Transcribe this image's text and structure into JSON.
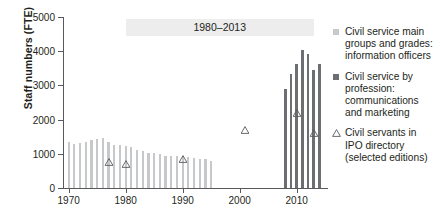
{
  "chart_data": {
    "type": "bar",
    "title": "",
    "xlabel": "",
    "ylabel": "Staff numbers (FTE)",
    "xlim": [
      1969,
      2015.5
    ],
    "ylim": [
      0,
      5000
    ],
    "ytick_labels": [
      "0",
      "1000",
      "2000",
      "3000",
      "4000",
      "5000"
    ],
    "ytick_values": [
      0,
      1000,
      2000,
      3000,
      4000,
      5000
    ],
    "xtick_labels": [
      "1970",
      "1980",
      "1990",
      "2000",
      "2010"
    ],
    "xtick_values": [
      1970,
      1980,
      1990,
      2000,
      2010
    ],
    "grid": false,
    "legend_position": "right",
    "annotations": [
      {
        "name": "range-band",
        "text": "1980–2013",
        "x_start": 1980,
        "x_end": 2013,
        "y": 4700
      }
    ],
    "series": [
      {
        "name": "Civil service main groups and grades: information officers",
        "type": "bar",
        "color": "#c7c8ca",
        "x": [
          1970,
          1971,
          1972,
          1973,
          1974,
          1975,
          1976,
          1977,
          1978,
          1979,
          1980,
          1981,
          1982,
          1983,
          1984,
          1985,
          1986,
          1987,
          1988,
          1989,
          1990,
          1991,
          1992,
          1993,
          1994,
          1995
        ],
        "values": [
          1350,
          1300,
          1320,
          1340,
          1390,
          1420,
          1460,
          1340,
          1270,
          1250,
          1240,
          1190,
          1110,
          1080,
          1030,
          1010,
          980,
          950,
          930,
          930,
          940,
          900,
          880,
          860,
          840,
          800
        ]
      },
      {
        "name": "Civil service by profession: communications and marketing",
        "type": "bar",
        "color": "#6d6e71",
        "x": [
          2008,
          2009,
          2010,
          2011,
          2012,
          2013,
          2014
        ],
        "values": [
          2900,
          3320,
          3620,
          4050,
          3930,
          3450,
          3620
        ]
      },
      {
        "name": "Civil servants in IPO directory (selected editions)",
        "type": "scatter",
        "marker": "triangle-open",
        "color": "#6d6e71",
        "x": [
          1977,
          1980,
          1990,
          2001,
          2010,
          2013
        ],
        "values": [
          760,
          700,
          860,
          1700,
          2200,
          1620
        ]
      }
    ]
  },
  "legend": {
    "items": [
      {
        "marker": "square-light",
        "lines": [
          "Civil service main",
          "groups and grades:",
          "information officers"
        ]
      },
      {
        "marker": "square-dark",
        "lines": [
          "Civil service by",
          "profession:",
          "communications",
          "and marketing"
        ]
      },
      {
        "marker": "triangle-open",
        "lines": [
          "Civil servants in",
          "IPO directory",
          "(selected editions)"
        ]
      }
    ]
  }
}
